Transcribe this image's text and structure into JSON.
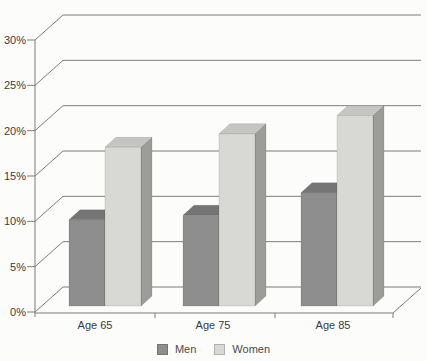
{
  "chart_data": {
    "type": "bar",
    "subtype": "3d-column",
    "title": "",
    "xlabel": "",
    "ylabel": "",
    "categories": [
      "Age 65",
      "Age 75",
      "Age 85"
    ],
    "series": [
      {
        "name": "Men",
        "values": [
          9.5,
          10,
          12.5
        ],
        "color_front": "#8e8e8e",
        "color_top": "#757575",
        "color_side": "#656565"
      },
      {
        "name": "Women",
        "values": [
          17.5,
          19,
          21
        ],
        "color_front": "#d8d8d5",
        "color_top": "#c5c5c2",
        "color_side": "#9c9c99"
      }
    ],
    "ylim": [
      0,
      30
    ],
    "ytick_step": 5,
    "ytick_labels": [
      "0%",
      "5%",
      "10%",
      "15%",
      "20%",
      "25%",
      "30%"
    ],
    "grid": true,
    "legend_position": "bottom-center",
    "line_color": "#7d7d7d",
    "text_color": "#3b3b3b"
  }
}
